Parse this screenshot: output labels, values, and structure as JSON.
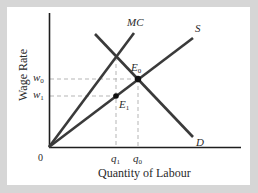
{
  "diagram": {
    "y_axis_title": "Wage Rate",
    "x_axis_title": "Quantity of Labour",
    "origin_label": "0",
    "curves": [
      {
        "name": "MC",
        "label": "MC",
        "from": [
          49,
          147
        ],
        "to": [
          134,
          33
        ]
      },
      {
        "name": "S",
        "label": "S",
        "from": [
          49,
          147
        ],
        "to": [
          193,
          38
        ]
      },
      {
        "name": "D",
        "label": "D",
        "from": [
          95,
          34
        ],
        "to": [
          193,
          137
        ]
      }
    ],
    "points": [
      {
        "name": "E0",
        "label": "E",
        "sub": "0",
        "x": 138,
        "y": 79
      },
      {
        "name": "E1",
        "label": "E",
        "sub": "1",
        "x": 116,
        "y": 96
      }
    ],
    "y_ticks": [
      {
        "label": "w",
        "sub": "0",
        "y": 79
      },
      {
        "label": "w",
        "sub": "1",
        "y": 96
      }
    ],
    "x_ticks": [
      {
        "label": "q",
        "sub": "1",
        "x": 116
      },
      {
        "label": "q",
        "sub": "0",
        "x": 138
      }
    ],
    "colors": {
      "frame": "#d6d6d6",
      "panel": "#ffffff",
      "line": "#3a3a3a",
      "dash": "#b0b0b0",
      "text": "#2a2a2a"
    }
  }
}
